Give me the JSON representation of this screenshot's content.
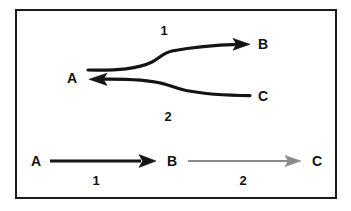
{
  "figure": {
    "kind": "reaction-pathway-diagram",
    "background_color": "#ffffff",
    "frame": {
      "stroke_color": "#1a1a1a",
      "stroke_width": 2,
      "x": 16,
      "y": 10,
      "width": 320,
      "height": 188
    },
    "colors": {
      "curve_black": "#141414",
      "arrow_gray": "#8a8a8a",
      "text": "#111111"
    },
    "top_panel": {
      "description": "Two curved reaction paths merging at a common point A: an upper path labeled 1 pointing right to B, and a lower path labeled 2 pointing left to A from C.",
      "nodes": [
        {
          "id": "node-a-curved",
          "label": "A",
          "x": 72,
          "y": 78
        },
        {
          "id": "node-b-curved",
          "label": "B",
          "x": 263,
          "y": 44
        },
        {
          "id": "node-c-curved",
          "label": "C",
          "x": 263,
          "y": 96
        }
      ],
      "steps": [
        {
          "id": "step-upper",
          "label": "1",
          "x": 164,
          "y": 30,
          "direction": "right",
          "color": "#141414"
        },
        {
          "id": "step-lower",
          "label": "2",
          "x": 168,
          "y": 116,
          "direction": "left",
          "color": "#141414"
        }
      ]
    },
    "bottom_panel": {
      "description": "Linear pathway A arrow 1 to B arrow 2 to C; first arrow black, second arrow gray.",
      "nodes": [
        {
          "id": "node-a-linear",
          "label": "A",
          "x": 36,
          "y": 161
        },
        {
          "id": "node-b-linear",
          "label": "B",
          "x": 172,
          "y": 161
        },
        {
          "id": "node-c-linear",
          "label": "C",
          "x": 317,
          "y": 161
        }
      ],
      "steps": [
        {
          "id": "step-linear-1",
          "label": "1",
          "x": 96,
          "y": 180,
          "color": "#141414"
        },
        {
          "id": "step-linear-2",
          "label": "2",
          "x": 243,
          "y": 180,
          "color": "#8a8a8a"
        }
      ]
    }
  }
}
